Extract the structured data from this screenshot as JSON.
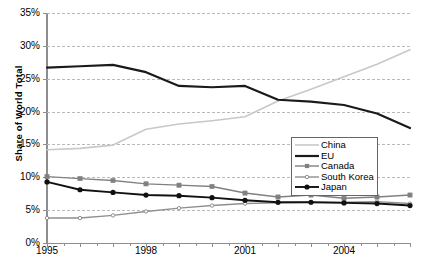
{
  "chart_data": {
    "type": "line",
    "title": "",
    "xlabel": "",
    "ylabel": "Share of World Total",
    "xlim": [
      1995,
      2006
    ],
    "ylim": [
      0,
      35
    ],
    "ytick_labels": [
      "0%",
      "5%",
      "10%",
      "15%",
      "20%",
      "25%",
      "30%",
      "35%"
    ],
    "ytick_values": [
      0,
      5,
      10,
      15,
      20,
      25,
      30,
      35
    ],
    "xtick_values": [
      1995,
      1996,
      1997,
      1998,
      1999,
      2000,
      2001,
      2002,
      2003,
      2004,
      2005,
      2006
    ],
    "xtick_labels": [
      "1995",
      "",
      "",
      "1998",
      "",
      "",
      "2001",
      "",
      "",
      "2004",
      "",
      ""
    ],
    "x": [
      1995,
      1996,
      1997,
      1998,
      1999,
      2000,
      2001,
      2002,
      2003,
      2004,
      2005,
      2006
    ],
    "grid": "horizontal-dashed",
    "legend_position": "lower-right-inside",
    "series": [
      {
        "name": "China",
        "color": "#c8c8c8",
        "width": 1.6,
        "marker": "none",
        "values": [
          14.2,
          14.4,
          14.9,
          17.3,
          18.1,
          18.6,
          19.2,
          21.6,
          23.4,
          25.3,
          27.2,
          29.4
        ]
      },
      {
        "name": "EU",
        "color": "#1a1a1a",
        "width": 2.2,
        "marker": "none",
        "values": [
          26.7,
          26.9,
          27.1,
          26.0,
          23.9,
          23.7,
          23.9,
          21.8,
          21.5,
          21.0,
          19.7,
          17.5
        ]
      },
      {
        "name": "Canada",
        "color": "#808080",
        "width": 1.4,
        "marker": "square",
        "values": [
          10.1,
          9.8,
          9.5,
          9.0,
          8.8,
          8.6,
          7.6,
          7.0,
          7.3,
          6.8,
          7.0,
          7.3
        ]
      },
      {
        "name": "South Korea",
        "color": "#8f8f8f",
        "width": 1.4,
        "marker": "dot",
        "values": [
          3.8,
          3.8,
          4.2,
          4.8,
          5.3,
          5.7,
          6.0,
          6.1,
          6.2,
          6.2,
          6.3,
          6.0
        ]
      },
      {
        "name": "Japan",
        "color": "#111111",
        "width": 1.9,
        "marker": "circle",
        "values": [
          9.3,
          8.1,
          7.7,
          7.3,
          7.2,
          6.9,
          6.5,
          6.2,
          6.2,
          6.1,
          6.0,
          5.7
        ]
      }
    ]
  },
  "legend": {
    "entries": [
      {
        "label": "China"
      },
      {
        "label": "EU"
      },
      {
        "label": "Canada"
      },
      {
        "label": "South Korea"
      },
      {
        "label": "Japan"
      }
    ]
  }
}
